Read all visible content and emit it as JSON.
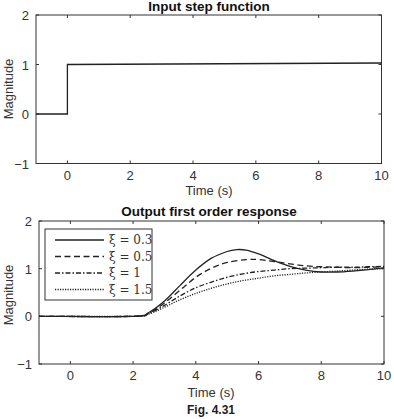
{
  "figure": {
    "caption": "Fig. 4.31"
  },
  "chart_data": [
    {
      "type": "line",
      "title": "Input step function",
      "xlabel": "Time (s)",
      "ylabel": "Magnitude",
      "xlim": [
        -1,
        10
      ],
      "ylim": [
        -1,
        2
      ],
      "xticks": [
        0,
        2,
        4,
        6,
        8,
        10
      ],
      "yticks": [
        -1,
        0,
        1,
        2
      ],
      "grid": false,
      "series": [
        {
          "name": "step",
          "style": "solid",
          "x": [
            -1,
            0,
            0,
            10
          ],
          "y": [
            0,
            0,
            1,
            1.03
          ]
        }
      ]
    },
    {
      "type": "line",
      "title": "Output first order response",
      "xlabel": "Time (s)",
      "ylabel": "Magnitude",
      "xlim": [
        -1,
        10
      ],
      "ylim": [
        -1,
        2
      ],
      "xticks": [
        0,
        2,
        4,
        6,
        8,
        10
      ],
      "yticks": [
        -1,
        0,
        1,
        2
      ],
      "grid": false,
      "legend_position": "upper left",
      "series": [
        {
          "name": "ξ = 0.3",
          "style": "solid",
          "x": [
            -1,
            2,
            2.5,
            3,
            3.5,
            4,
            4.5,
            5,
            5.3,
            5.6,
            6,
            6.5,
            7,
            7.5,
            8,
            8.5,
            9,
            9.5,
            10
          ],
          "y": [
            0,
            0,
            0.08,
            0.32,
            0.65,
            0.97,
            1.22,
            1.36,
            1.4,
            1.39,
            1.31,
            1.17,
            1.05,
            0.97,
            0.93,
            0.93,
            0.95,
            0.98,
            1.02
          ]
        },
        {
          "name": "ξ = 0.5",
          "style": "dashed",
          "x": [
            -1,
            2,
            2.5,
            3,
            3.5,
            4,
            4.5,
            5,
            5.6,
            6,
            6.5,
            7,
            7.5,
            8,
            8.5,
            9,
            9.5,
            10
          ],
          "y": [
            0,
            0,
            0.07,
            0.28,
            0.55,
            0.82,
            1.01,
            1.13,
            1.19,
            1.19,
            1.15,
            1.1,
            1.06,
            1.04,
            1.03,
            1.02,
            1.03,
            1.04
          ]
        },
        {
          "name": "ξ = 1",
          "style": "dashdot",
          "x": [
            -1,
            2,
            2.5,
            3,
            3.5,
            4,
            4.5,
            5,
            5.5,
            6,
            6.5,
            7,
            7.5,
            8,
            8.5,
            9,
            9.5,
            10
          ],
          "y": [
            0,
            0,
            0.06,
            0.23,
            0.43,
            0.6,
            0.72,
            0.82,
            0.89,
            0.94,
            0.97,
            1.0,
            1.01,
            1.02,
            1.03,
            1.03,
            1.04,
            1.05
          ]
        },
        {
          "name": "ξ = 1.5",
          "style": "dotted",
          "x": [
            -1,
            2,
            2.5,
            3,
            3.5,
            4,
            4.5,
            5,
            5.5,
            6,
            6.5,
            7,
            7.5,
            8,
            8.5,
            9,
            9.5,
            10
          ],
          "y": [
            0,
            0,
            0.05,
            0.19,
            0.35,
            0.48,
            0.59,
            0.68,
            0.75,
            0.8,
            0.85,
            0.88,
            0.91,
            0.93,
            0.95,
            0.97,
            0.99,
            1.0
          ]
        }
      ]
    }
  ]
}
